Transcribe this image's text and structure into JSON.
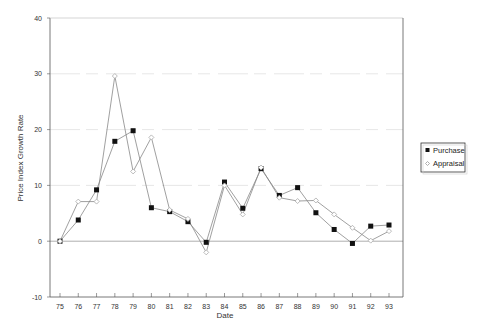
{
  "chart_data": {
    "type": "line",
    "title": "",
    "xlabel": "Date",
    "ylabel": "Price Index Growth Rate",
    "x": [
      "75",
      "76",
      "77",
      "78",
      "79",
      "80",
      "81",
      "82",
      "83",
      "84",
      "85",
      "86",
      "87",
      "88",
      "89",
      "90",
      "91",
      "92",
      "93"
    ],
    "ylim": [
      -10,
      40
    ],
    "yticks": [
      -10,
      0,
      10,
      20,
      30,
      40
    ],
    "grid": true,
    "legend_position": "right",
    "series": [
      {
        "name": "Purchase",
        "marker": "filled-square",
        "values": [
          0,
          3.8,
          9.2,
          17.9,
          19.8,
          6.0,
          5.3,
          3.5,
          -0.2,
          10.6,
          5.9,
          13.0,
          8.2,
          9.6,
          5.1,
          2.1,
          -0.4,
          2.7,
          2.9
        ]
      },
      {
        "name": "Appraisal",
        "marker": "open-diamond",
        "values": [
          0,
          7.1,
          7.1,
          29.6,
          12.5,
          18.6,
          5.6,
          4.0,
          -2.0,
          10.0,
          4.8,
          13.2,
          7.8,
          7.2,
          7.3,
          4.8,
          2.4,
          0.1,
          1.8
        ]
      }
    ]
  },
  "legend": {
    "items": [
      {
        "label": "Purchase"
      },
      {
        "label": "Appraisal"
      }
    ]
  },
  "colors": {
    "axis": "#555555",
    "line": "#888888",
    "purchase_marker": "#111111",
    "appraisal_marker": "#aaaaaa",
    "grid": "#dddddd"
  }
}
